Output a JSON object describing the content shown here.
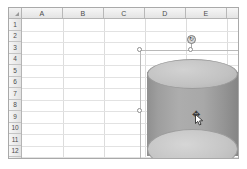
{
  "app": {
    "type": "spreadsheet",
    "name": "worksheet-grid"
  },
  "grid": {
    "corner_label": "select-all",
    "columns": [
      "A",
      "B",
      "C",
      "D",
      "E",
      "F",
      "G"
    ],
    "column_widths": [
      41,
      41,
      41,
      41,
      41,
      41,
      41
    ],
    "rows": [
      "1",
      "2",
      "3",
      "4",
      "5",
      "6",
      "7",
      "8",
      "9",
      "10",
      "11",
      "12"
    ],
    "row_height": 11.5,
    "cells": []
  },
  "shape": {
    "name": "cylinder",
    "type": "3d-cylinder",
    "selected": true,
    "fill_color": "#a8a8a8",
    "top_face_color": "#c6c6c6",
    "bottom_face_color": "#c6c6c6",
    "outline_color": "#9a9a9a",
    "bounds": {
      "left": 118,
      "top": 31,
      "width": 102,
      "height": 121
    }
  },
  "selection": {
    "handle_fill": "#ffffff",
    "handle_border": "#8d8d8d",
    "frame_color": "#b9b9b9",
    "handles": [
      "top-left",
      "top-center",
      "top-right",
      "middle-left",
      "middle-right",
      "bottom-left",
      "bottom-center",
      "bottom-right"
    ],
    "rotation_handle": {
      "glyph": "↻",
      "color": "#4a4a4a"
    }
  },
  "cursor": {
    "kind": "move",
    "glyph": "✥",
    "color": "#3a3a3a"
  }
}
